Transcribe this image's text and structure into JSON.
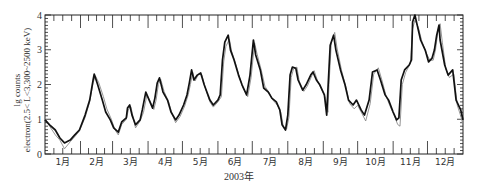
{
  "chart_data": {
    "type": "line",
    "title": "",
    "xlabel": "2003年",
    "ylabel_line1": "lg counts",
    "ylabel_line2": "electron(2.5< L<3,300~2500 keV)",
    "ylim": [
      0,
      4
    ],
    "yticks": [
      "0",
      "1",
      "2",
      "3",
      "4"
    ],
    "xlim_days": [
      0,
      365
    ],
    "month_labels": [
      "1月",
      "2月",
      "3月",
      "4月",
      "5月",
      "6月",
      "7月",
      "8月",
      "9月",
      "10月",
      "11月",
      "12月"
    ],
    "grid": false,
    "legend": "none",
    "colors": {
      "main": "#111111",
      "secondary": "#8a8a8a",
      "axis": "#222222"
    },
    "series": [
      {
        "name": "observed",
        "style": "thick-black",
        "points_day_value": [
          [
            0,
            0.98
          ],
          [
            4,
            0.84
          ],
          [
            9,
            0.69
          ],
          [
            13,
            0.46
          ],
          [
            17,
            0.32
          ],
          [
            22,
            0.4
          ],
          [
            26,
            0.55
          ],
          [
            30,
            0.69
          ],
          [
            35,
            1.12
          ],
          [
            39,
            1.55
          ],
          [
            42,
            2.13
          ],
          [
            43,
            2.3
          ],
          [
            46,
            1.99
          ],
          [
            50,
            1.55
          ],
          [
            53,
            1.21
          ],
          [
            57,
            0.98
          ],
          [
            60,
            0.75
          ],
          [
            64,
            0.63
          ],
          [
            67,
            0.92
          ],
          [
            71,
            1.04
          ],
          [
            72,
            1.32
          ],
          [
            74,
            1.41
          ],
          [
            76,
            1.12
          ],
          [
            79,
            0.84
          ],
          [
            83,
            0.98
          ],
          [
            85,
            1.27
          ],
          [
            88,
            1.78
          ],
          [
            91,
            1.55
          ],
          [
            94,
            1.32
          ],
          [
            96,
            1.61
          ],
          [
            98,
            2.04
          ],
          [
            100,
            2.19
          ],
          [
            103,
            1.78
          ],
          [
            107,
            1.55
          ],
          [
            110,
            1.21
          ],
          [
            114,
            0.98
          ],
          [
            117,
            1.12
          ],
          [
            121,
            1.41
          ],
          [
            124,
            1.7
          ],
          [
            126,
            2.04
          ],
          [
            128,
            2.42
          ],
          [
            130,
            2.13
          ],
          [
            133,
            2.27
          ],
          [
            136,
            2.33
          ],
          [
            139,
            1.99
          ],
          [
            144,
            1.55
          ],
          [
            147,
            1.41
          ],
          [
            151,
            1.55
          ],
          [
            153,
            1.7
          ],
          [
            155,
            2.71
          ],
          [
            157,
            3.22
          ],
          [
            160,
            3.42
          ],
          [
            162,
            2.99
          ],
          [
            165,
            2.71
          ],
          [
            169,
            2.27
          ],
          [
            172,
            1.99
          ],
          [
            176,
            1.7
          ],
          [
            179,
            2.27
          ],
          [
            182,
            3.28
          ],
          [
            184,
            2.85
          ],
          [
            188,
            2.42
          ],
          [
            191,
            1.9
          ],
          [
            195,
            1.78
          ],
          [
            198,
            1.61
          ],
          [
            202,
            1.5
          ],
          [
            205,
            1.27
          ],
          [
            207,
            0.84
          ],
          [
            210,
            0.69
          ],
          [
            212,
            1.12
          ],
          [
            214,
            2.27
          ],
          [
            216,
            2.5
          ],
          [
            219,
            2.47
          ],
          [
            221,
            2.13
          ],
          [
            225,
            1.84
          ],
          [
            228,
            1.99
          ],
          [
            232,
            2.27
          ],
          [
            234,
            2.36
          ],
          [
            237,
            2.13
          ],
          [
            240,
            1.99
          ],
          [
            244,
            1.7
          ],
          [
            246,
            1.12
          ],
          [
            247,
            1.84
          ],
          [
            249,
            3.13
          ],
          [
            252,
            3.42
          ],
          [
            254,
            2.99
          ],
          [
            258,
            2.42
          ],
          [
            262,
            1.99
          ],
          [
            265,
            1.55
          ],
          [
            269,
            1.41
          ],
          [
            272,
            1.55
          ],
          [
            276,
            1.27
          ],
          [
            279,
            1.12
          ],
          [
            283,
            1.55
          ],
          [
            286,
            2.36
          ],
          [
            290,
            2.42
          ],
          [
            293,
            2.13
          ],
          [
            297,
            1.7
          ],
          [
            300,
            1.55
          ],
          [
            304,
            1.21
          ],
          [
            307,
            0.98
          ],
          [
            309,
            1.04
          ],
          [
            311,
            2.13
          ],
          [
            314,
            2.42
          ],
          [
            318,
            2.56
          ],
          [
            320,
            2.71
          ],
          [
            321,
            3.8
          ],
          [
            323,
            4.0
          ],
          [
            325,
            3.71
          ],
          [
            328,
            3.28
          ],
          [
            332,
            2.99
          ],
          [
            335,
            2.65
          ],
          [
            338,
            2.76
          ],
          [
            340,
            2.99
          ],
          [
            342,
            3.42
          ],
          [
            344,
            3.71
          ],
          [
            345,
            3.28
          ],
          [
            349,
            2.56
          ],
          [
            352,
            2.27
          ],
          [
            356,
            2.42
          ],
          [
            359,
            1.55
          ],
          [
            363,
            1.27
          ],
          [
            365,
            0.98
          ]
        ]
      },
      {
        "name": "model",
        "style": "thin-gray",
        "points_day_value": [
          [
            0,
            1.04
          ],
          [
            4,
            0.8
          ],
          [
            9,
            0.55
          ],
          [
            13,
            0.4
          ],
          [
            17,
            0.15
          ],
          [
            22,
            0.35
          ],
          [
            26,
            0.5
          ],
          [
            30,
            0.66
          ],
          [
            35,
            1.05
          ],
          [
            39,
            1.5
          ],
          [
            42,
            2.05
          ],
          [
            44,
            2.25
          ],
          [
            47,
            2.05
          ],
          [
            51,
            1.65
          ],
          [
            54,
            1.3
          ],
          [
            58,
            1.0
          ],
          [
            61,
            0.7
          ],
          [
            64,
            0.55
          ],
          [
            67,
            0.85
          ],
          [
            71,
            1.0
          ],
          [
            73,
            1.3
          ],
          [
            75,
            1.36
          ],
          [
            77,
            1.05
          ],
          [
            79,
            0.75
          ],
          [
            83,
            0.95
          ],
          [
            86,
            1.2
          ],
          [
            89,
            1.7
          ],
          [
            92,
            1.5
          ],
          [
            95,
            1.28
          ],
          [
            97,
            1.55
          ],
          [
            99,
            2.0
          ],
          [
            101,
            2.15
          ],
          [
            104,
            1.8
          ],
          [
            108,
            1.5
          ],
          [
            111,
            1.15
          ],
          [
            114,
            0.9
          ],
          [
            118,
            1.08
          ],
          [
            122,
            1.38
          ],
          [
            125,
            1.7
          ],
          [
            127,
            2.0
          ],
          [
            129,
            2.35
          ],
          [
            131,
            2.1
          ],
          [
            134,
            2.3
          ],
          [
            137,
            2.28
          ],
          [
            140,
            1.9
          ],
          [
            144,
            1.5
          ],
          [
            147,
            1.35
          ],
          [
            151,
            1.5
          ],
          [
            154,
            1.65
          ],
          [
            156,
            2.65
          ],
          [
            158,
            3.1
          ],
          [
            161,
            3.3
          ],
          [
            163,
            2.95
          ],
          [
            166,
            2.65
          ],
          [
            170,
            2.2
          ],
          [
            173,
            1.9
          ],
          [
            177,
            1.65
          ],
          [
            180,
            2.2
          ],
          [
            183,
            3.2
          ],
          [
            185,
            2.9
          ],
          [
            189,
            2.4
          ],
          [
            192,
            1.95
          ],
          [
            196,
            1.75
          ],
          [
            199,
            1.55
          ],
          [
            203,
            1.4
          ],
          [
            206,
            1.2
          ],
          [
            208,
            0.8
          ],
          [
            211,
            0.72
          ],
          [
            213,
            1.05
          ],
          [
            215,
            2.2
          ],
          [
            217,
            2.45
          ],
          [
            220,
            2.5
          ],
          [
            222,
            2.1
          ],
          [
            226,
            1.8
          ],
          [
            229,
            1.95
          ],
          [
            233,
            2.25
          ],
          [
            235,
            2.4
          ],
          [
            238,
            2.1
          ],
          [
            241,
            1.9
          ],
          [
            245,
            1.6
          ],
          [
            247,
            1.2
          ],
          [
            248,
            2.0
          ],
          [
            250,
            3.2
          ],
          [
            253,
            3.5
          ],
          [
            255,
            3.05
          ],
          [
            259,
            2.4
          ],
          [
            263,
            1.9
          ],
          [
            266,
            1.45
          ],
          [
            270,
            1.3
          ],
          [
            273,
            1.4
          ],
          [
            277,
            1.15
          ],
          [
            280,
            0.95
          ],
          [
            284,
            1.45
          ],
          [
            287,
            2.3
          ],
          [
            291,
            2.48
          ],
          [
            294,
            2.15
          ],
          [
            298,
            1.65
          ],
          [
            301,
            1.4
          ],
          [
            305,
            1.1
          ],
          [
            308,
            0.85
          ],
          [
            310,
            0.8
          ],
          [
            312,
            2.0
          ],
          [
            315,
            2.35
          ],
          [
            319,
            2.6
          ],
          [
            321,
            3.6
          ],
          [
            323,
            3.85
          ],
          [
            326,
            3.65
          ],
          [
            329,
            3.25
          ],
          [
            333,
            2.9
          ],
          [
            336,
            2.7
          ],
          [
            339,
            2.7
          ],
          [
            341,
            3.0
          ],
          [
            343,
            3.5
          ],
          [
            345,
            3.75
          ],
          [
            347,
            3.2
          ],
          [
            350,
            2.45
          ],
          [
            353,
            2.2
          ],
          [
            357,
            2.3
          ],
          [
            360,
            1.4
          ],
          [
            363,
            1.1
          ],
          [
            365,
            0.85
          ]
        ]
      }
    ]
  }
}
